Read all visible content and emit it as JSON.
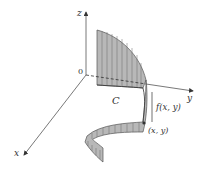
{
  "figure": {
    "axes": {
      "z_label": "z",
      "y_label": "y",
      "x_label": "x",
      "origin_label": "0"
    },
    "curve_label": "C",
    "height_label": "f(x, y)",
    "point_label": "(x, y)",
    "colors": {
      "axis": "#555555",
      "surface_fill": "#b8b8b8",
      "surface_stroke": "#555555",
      "ruling": "#6a6a6a",
      "text": "#333333"
    }
  }
}
